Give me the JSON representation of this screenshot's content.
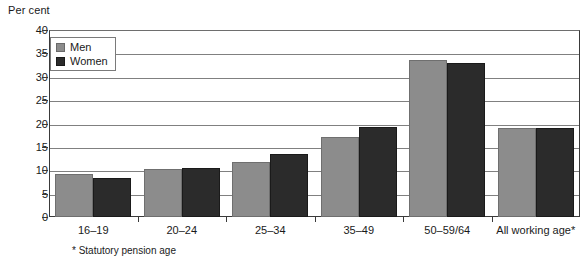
{
  "chart_data": {
    "type": "bar",
    "title": "",
    "ylabel": "Per cent",
    "xlabel": "",
    "ylim": [
      0,
      40
    ],
    "ytick_step": 5,
    "yticks": [
      "40",
      "35",
      "30",
      "25",
      "20",
      "15",
      "10",
      "5",
      "0"
    ],
    "grid": true,
    "legend_position": "top-left",
    "categories": [
      "16–19",
      "20–24",
      "25–34",
      "35–49",
      "50–59/64",
      "All working age*"
    ],
    "series": [
      {
        "name": "Men",
        "color": "#8c8c8c",
        "values": [
          9.3,
          10.3,
          11.8,
          17.1,
          33.5,
          19.0
        ]
      },
      {
        "name": "Women",
        "color": "#2b2b2b",
        "values": [
          8.3,
          10.4,
          13.4,
          19.3,
          33.0,
          19.0
        ]
      }
    ],
    "footnote": "* Statutory pension age"
  },
  "colors": {
    "men": "#8c8c8c",
    "women": "#2b2b2b",
    "axis": "#3a3a3a",
    "grid": "#808080",
    "background": "#ffffff"
  }
}
